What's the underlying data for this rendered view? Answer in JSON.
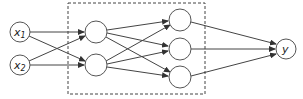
{
  "diagram": {
    "type": "feedforward-neural-network",
    "inputs": [
      {
        "label": "x",
        "subscript": "1"
      },
      {
        "label": "x",
        "subscript": "2"
      }
    ],
    "hidden_layers": [
      {
        "nodes": 2
      },
      {
        "nodes": 3
      }
    ],
    "output": {
      "label": "y"
    },
    "hidden_box": "dashed",
    "colors": {
      "stroke": "#444444",
      "fill": "#ffffff"
    }
  }
}
